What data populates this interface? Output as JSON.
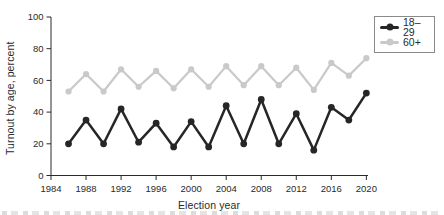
{
  "chart_data": {
    "type": "line",
    "title": "",
    "xlabel": "Election year",
    "ylabel": "Turnout by age, percent",
    "x": [
      1986,
      1988,
      1990,
      1992,
      1994,
      1996,
      1998,
      2000,
      2002,
      2004,
      2006,
      2008,
      2010,
      2012,
      2014,
      2016,
      2018,
      2020
    ],
    "series": [
      {
        "name": "18–29",
        "color": "#262626",
        "values": [
          20,
          35,
          20,
          42,
          21,
          33,
          18,
          34,
          18,
          44,
          20,
          48,
          20,
          39,
          16,
          43,
          35,
          52
        ]
      },
      {
        "name": "60+",
        "color": "#c9c9c9",
        "values": [
          53,
          64,
          53,
          67,
          56,
          66,
          55,
          67,
          56,
          69,
          57,
          69,
          57,
          68,
          54,
          71,
          63,
          74
        ]
      }
    ],
    "xticks": [
      1984,
      1988,
      1992,
      1996,
      2000,
      2004,
      2008,
      2012,
      2016,
      2020
    ],
    "yticks": [
      0,
      20,
      40,
      60,
      80,
      100
    ],
    "xlim": [
      1984,
      2021
    ],
    "ylim": [
      0,
      100
    ],
    "grid": false,
    "legend_position": "top-right",
    "axis_color": "#2a2a2a",
    "tick_label_color": "#2a2a2a"
  }
}
